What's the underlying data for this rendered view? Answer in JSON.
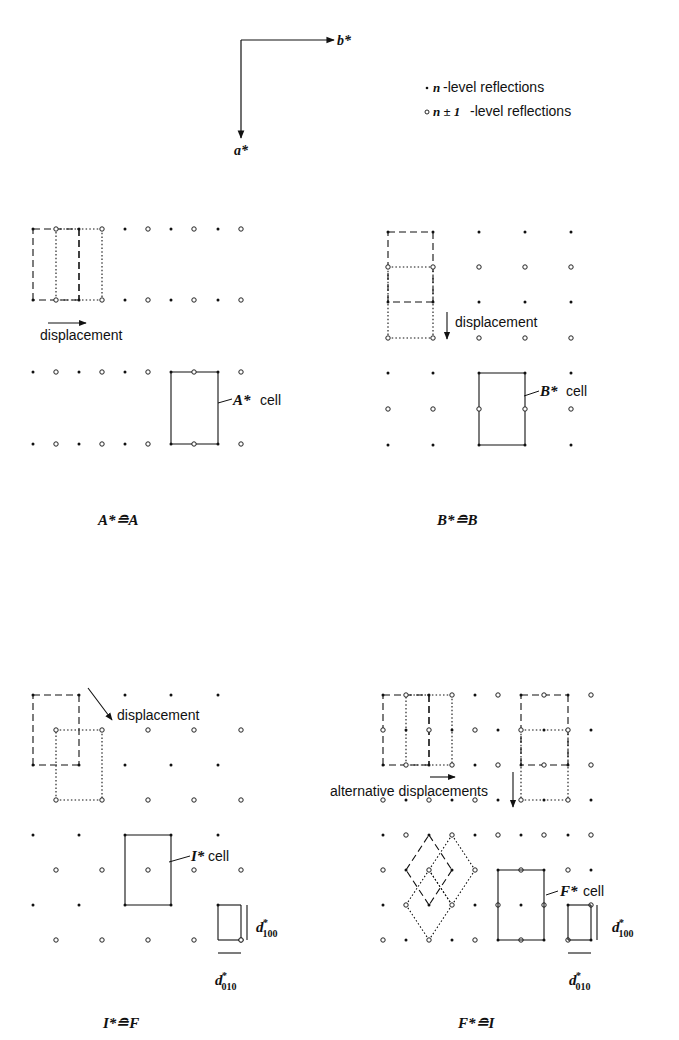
{
  "axes": {
    "horizontal_label": "b*",
    "vertical_label": "a*"
  },
  "legend": {
    "items": [
      {
        "marker": "filled-dot",
        "symbol": "n",
        "text": "-level reflections"
      },
      {
        "marker": "open-circle",
        "symbol": "n ± 1",
        "text": "-level reflections"
      }
    ]
  },
  "panels": {
    "A": {
      "displacement_label": "displacement",
      "cell_label": "A*",
      "cell_suffix": "cell",
      "caption": "A*≘A"
    },
    "B": {
      "displacement_label": "displacement",
      "cell_label": "B*",
      "cell_suffix": "cell",
      "caption": "B*≘B"
    },
    "I": {
      "displacement_label": "displacement",
      "cell_label": "I*",
      "cell_suffix": "cell",
      "d100": "d",
      "d100_sup": "*",
      "d100_sub": "100",
      "d010": "d",
      "d010_sup": "*",
      "d010_sub": "010",
      "caption": "I*≘F"
    },
    "F": {
      "displacement_label": "alternative displacements",
      "cell_label": "F*",
      "cell_suffix": "cell",
      "d100": "d",
      "d100_sup": "*",
      "d100_sub": "100",
      "d010": "d",
      "d010_sup": "*",
      "d010_sub": "010",
      "caption": "F*≘I"
    }
  }
}
